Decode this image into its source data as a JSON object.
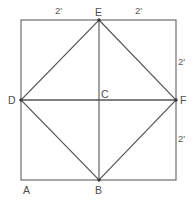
{
  "figure": {
    "type": "geometry-diagram",
    "canvas": {
      "width": 194,
      "height": 206
    },
    "square": {
      "stroke_color": "#6e6e6e",
      "stroke_width": 1.2,
      "fill": "none",
      "x": 21,
      "y": 20,
      "width": 155,
      "height": 160
    },
    "diamond": {
      "stroke_color": "#555555",
      "stroke_width": 1.1,
      "fill": "none",
      "points": "99,20 176,100 99,180 21,100"
    },
    "segments": [
      {
        "name": "vertical-EB",
        "x1": 99,
        "y1": 20,
        "x2": 99,
        "y2": 180,
        "stroke_color": "#555555",
        "stroke_width": 1.1
      },
      {
        "name": "horizontal-DF",
        "x1": 21,
        "y1": 100,
        "x2": 176,
        "y2": 100,
        "stroke_color": "#555555",
        "stroke_width": 1.3
      }
    ],
    "vertex_dots": [
      {
        "name": "dot-E",
        "cx": 99,
        "cy": 20,
        "r": 1.7
      },
      {
        "name": "dot-D",
        "cx": 21,
        "cy": 100,
        "r": 1.7
      },
      {
        "name": "dot-F",
        "cx": 176,
        "cy": 100,
        "r": 1.7
      },
      {
        "name": "dot-B",
        "cx": 99,
        "cy": 180,
        "r": 1.7
      }
    ]
  },
  "labels": {
    "point_a": "A",
    "point_b": "B",
    "point_c": "C",
    "point_d": "D",
    "point_e": "E",
    "point_f": "F"
  },
  "dimensions": {
    "top_left": "2'",
    "top_right": "2'",
    "right_upper": "2'",
    "right_lower": "2'"
  },
  "colors": {
    "background": "#ffffff",
    "line": "#555555",
    "square_outline": "#6e6e6e",
    "text": "#4a4a4a"
  }
}
